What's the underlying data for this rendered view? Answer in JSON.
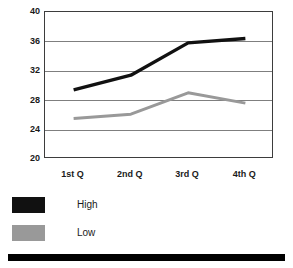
{
  "chart_data": {
    "type": "line",
    "title": "",
    "xlabel": "",
    "ylabel": "",
    "categories": [
      "1st Q",
      "2nd Q",
      "3rd Q",
      "4th Q"
    ],
    "series": [
      {
        "name": "High",
        "color": "#111111",
        "values": [
          29.4,
          31.4,
          35.8,
          36.4
        ]
      },
      {
        "name": "Low",
        "color": "#999999",
        "values": [
          25.5,
          26.1,
          29.0,
          27.6
        ]
      }
    ],
    "ylim": [
      20,
      40
    ],
    "yticks": [
      40,
      36,
      32,
      28,
      24,
      20
    ],
    "ytick_labels": [
      "40",
      "36",
      "32",
      "28",
      "24",
      "20"
    ],
    "grid": true,
    "grid_color": "#7f7f7f",
    "legend_position": "below-left",
    "plot_border_color": "#3d3d3d",
    "background": "#ffffff"
  },
  "legend": {
    "entries": [
      {
        "label": "High",
        "color": "#111111"
      },
      {
        "label": "Low",
        "color": "#999999"
      }
    ]
  },
  "decoration": {
    "bottom_bar_color": "#000000"
  }
}
